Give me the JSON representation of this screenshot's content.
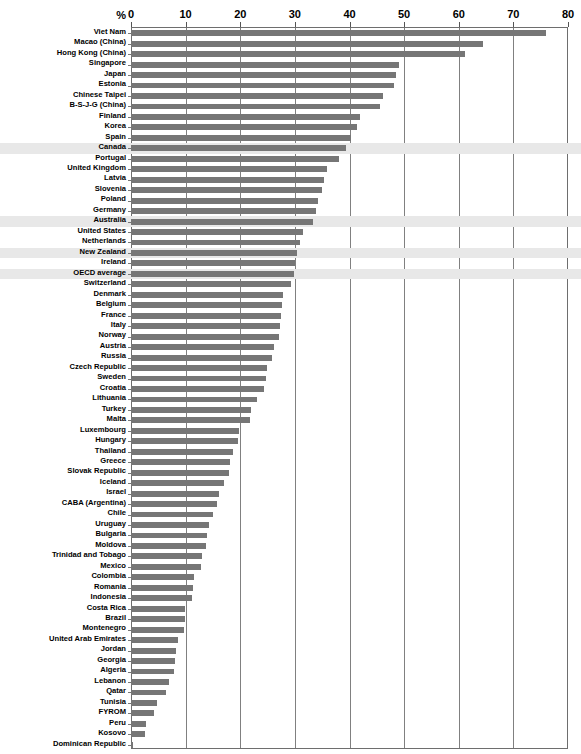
{
  "chart_data": {
    "type": "bar",
    "orientation": "horizontal",
    "title": "",
    "xlabel": "%",
    "ylabel": "",
    "xlim": [
      0,
      80
    ],
    "xticks": [
      0,
      10,
      20,
      30,
      40,
      50,
      60,
      70,
      80
    ],
    "grid": true,
    "legend": null,
    "axis_unit_label": "%",
    "highlight_color": "#e8e8e8",
    "bar_color": "#767676",
    "highlighted_categories": [
      "Canada",
      "Australia",
      "New Zealand",
      "OECD average"
    ],
    "categories": [
      "Viet Nam",
      "Macao (China)",
      "Hong Kong (China)",
      "Singapore",
      "Japan",
      "Estonia",
      "Chinese Taipei",
      "B-S-J-G (China)",
      "Finland",
      "Korea",
      "Spain",
      "Canada",
      "Portugal",
      "United Kingdom",
      "Latvia",
      "Slovenia",
      "Poland",
      "Germany",
      "Australia",
      "United States",
      "Netherlands",
      "New Zealand",
      "Ireland",
      "OECD average",
      "Switzerland",
      "Denmark",
      "Belgium",
      "France",
      "Italy",
      "Norway",
      "Austria",
      "Russia",
      "Czech Republic",
      "Sweden",
      "Croatia",
      "Lithuania",
      "Turkey",
      "Malta",
      "Luxembourg",
      "Hungary",
      "Thailand",
      "Greece",
      "Slovak Republic",
      "Iceland",
      "Israel",
      "CABA (Argentina)",
      "Chile",
      "Uruguay",
      "Bulgaria",
      "Moldova",
      "Trinidad and Tobago",
      "Mexico",
      "Colombia",
      "Romania",
      "Indonesia",
      "Costa Rica",
      "Brazil",
      "Montenegro",
      "United Arab Emirates",
      "Jordan",
      "Georgia",
      "Algeria",
      "Lebanon",
      "Qatar",
      "Tunisia",
      "FYROM",
      "Peru",
      "Kosovo",
      "Dominican Republic"
    ],
    "values": [
      75.9,
      64.4,
      61.2,
      49.1,
      48.6,
      48.1,
      46.1,
      45.6,
      41.9,
      41.4,
      40.3,
      39.3,
      38.0,
      35.8,
      35.3,
      34.9,
      34.2,
      33.8,
      33.4,
      31.4,
      31.0,
      30.3,
      30.1,
      29.8,
      29.2,
      27.9,
      27.6,
      27.4,
      27.2,
      27.1,
      26.2,
      25.9,
      24.9,
      24.7,
      24.3,
      23.1,
      21.9,
      21.8,
      19.8,
      19.5,
      18.6,
      18.1,
      17.9,
      17.0,
      16.1,
      15.7,
      15.0,
      14.2,
      13.9,
      13.8,
      13.0,
      12.8,
      11.6,
      11.4,
      11.1,
      9.9,
      9.8,
      9.7,
      8.6,
      8.2,
      8.1,
      7.9,
      6.9,
      6.4,
      4.8,
      4.2,
      2.8,
      2.6,
      0.3
    ]
  }
}
